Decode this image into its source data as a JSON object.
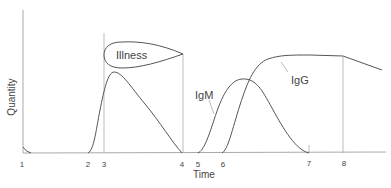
{
  "diagram": {
    "x_axis_label": "Time",
    "y_axis_label": "Quantity",
    "ticks": [
      {
        "label": "1",
        "x": 22
      },
      {
        "label": "2",
        "x": 88
      },
      {
        "label": "3",
        "x": 104
      },
      {
        "label": "4",
        "x": 182
      },
      {
        "label": "5",
        "x": 198
      },
      {
        "label": "6",
        "x": 222
      },
      {
        "label": "7",
        "x": 309
      },
      {
        "label": "8",
        "x": 343
      }
    ],
    "shapes": {
      "illness_label": "Illness",
      "igm_label": "IgM",
      "igg_label": "IgG"
    },
    "colors": {
      "line": "#555555",
      "axis": "#999999",
      "text": "#444444"
    }
  }
}
